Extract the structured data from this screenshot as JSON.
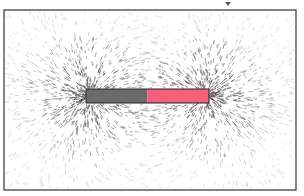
{
  "scene": {
    "description": "Iron filings showing magnetic field lines around a bar magnet",
    "background": "#ffffff",
    "frame": {
      "x": 4,
      "y": 10,
      "width": 292,
      "height": 180,
      "stroke": "#333333"
    },
    "marker": {
      "x": 228,
      "y": 2,
      "color": "#555555"
    },
    "magnet": {
      "x": 86,
      "y": 89,
      "width": 123,
      "height": 14,
      "south_color": "#6b6b6b",
      "north_color": "#f2607a",
      "outline": "#222222"
    },
    "filings": {
      "count": 2600,
      "color": "#3a3a3a",
      "seed": 7
    }
  }
}
